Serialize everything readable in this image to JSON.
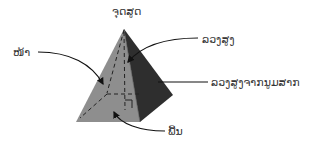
{
  "diagram": {
    "labels": {
      "apex": "ຈຸດສູດ",
      "face": "ໜ້າ",
      "height": "ລວງສູງ",
      "slant_height": "ລວງສູງຈາກນູມສາກ",
      "base": "ພື້ນ"
    },
    "colors": {
      "front_face": "#8e8e8e",
      "side_face": "#2e2e2e",
      "hidden_lines": "#222222",
      "arrows": "#111111",
      "text": "#333333",
      "background": "#ffffff"
    },
    "vertices": {
      "apex": [
        124,
        29
      ],
      "base_front_left": [
        76,
        122
      ],
      "base_front_right": [
        140,
        122
      ],
      "base_back_right": [
        173,
        95
      ],
      "base_back_left": [
        107,
        94
      ],
      "base_center": [
        125,
        96
      ]
    }
  }
}
